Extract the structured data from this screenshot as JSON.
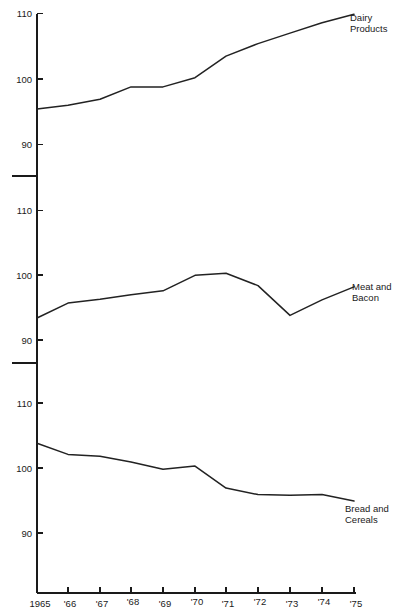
{
  "chart_data": {
    "type": "line",
    "title": "",
    "subtitle": "",
    "xlabel": "",
    "ylabel": "",
    "grid": false,
    "legend_position": "inline-right",
    "panel_layout": "three stacked panels sharing one x axis, each y axis broken below 90",
    "x": [
      1965,
      1966,
      1967,
      1968,
      1969,
      1970,
      1971,
      1972,
      1973,
      1974,
      1975
    ],
    "categories": [
      "1965",
      "'66",
      "'67",
      "'68",
      "'69",
      "'70",
      "'71",
      "'72",
      "'73",
      "'74",
      "'75"
    ],
    "xtick_labels": [
      "1965",
      "'66",
      "'67",
      "'68",
      "'69",
      "'70",
      "'71",
      "'72",
      "'73",
      "'74",
      "'75"
    ],
    "ytick_labels": [
      "110",
      "100",
      "90"
    ],
    "ylim": [
      90,
      110
    ],
    "panels": [
      {
        "name": "Dairy Products",
        "label": "Dairy Products",
        "label_lines": [
          "Dairy",
          "Products"
        ],
        "ytick_labels": [
          "110",
          "100",
          "90"
        ],
        "yticks": [
          110,
          100,
          90
        ],
        "ylim": [
          90,
          110
        ],
        "values": [
          95.4,
          96.0,
          96.9,
          98.8,
          98.8,
          100.2,
          103.5,
          105.4,
          107.0,
          108.6,
          109.9
        ]
      },
      {
        "name": "Meat and Bacon",
        "label": "Meat and Bacon",
        "label_lines": [
          "Meat and",
          "Bacon"
        ],
        "ytick_labels": [
          "110",
          "100",
          "90"
        ],
        "yticks": [
          110,
          100,
          90
        ],
        "ylim": [
          90,
          110
        ],
        "values": [
          93.4,
          95.7,
          96.3,
          97.0,
          97.6,
          100.0,
          100.3,
          98.4,
          93.8,
          96.2,
          98.2
        ]
      },
      {
        "name": "Bread and Cereals",
        "label": "Bread and Cereals",
        "label_lines": [
          "Bread and",
          "Cereals"
        ],
        "ytick_labels": [
          "110",
          "100",
          "90"
        ],
        "yticks": [
          110,
          100,
          90
        ],
        "ylim": [
          90,
          110
        ],
        "values": [
          103.8,
          102.1,
          101.8,
          100.9,
          99.8,
          100.3,
          96.9,
          95.9,
          95.8,
          95.9,
          94.9
        ]
      }
    ]
  },
  "axis": {
    "panel1": {
      "tick_110": "110",
      "tick_100": "100",
      "tick_90": "90"
    },
    "panel2": {
      "tick_110": "110",
      "tick_100": "100",
      "tick_90": "90"
    },
    "panel3": {
      "tick_110": "110",
      "tick_100": "100",
      "tick_90": "90"
    },
    "x_labels": [
      "1965",
      "'66",
      "'67",
      "'68",
      "'69",
      "'70",
      "'71",
      "'72",
      "'73",
      "'74",
      "'75"
    ]
  },
  "labels": {
    "dairy_line1": "Dairy",
    "dairy_line2": "Products",
    "meat_line1": "Meat and",
    "meat_line2": "Bacon",
    "bread_line1": "Bread and",
    "bread_line2": "Cereals"
  },
  "colors": {
    "line": "#222222",
    "axis": "#1a1a1a",
    "text": "#1a1a1a",
    "background": "#ffffff"
  }
}
